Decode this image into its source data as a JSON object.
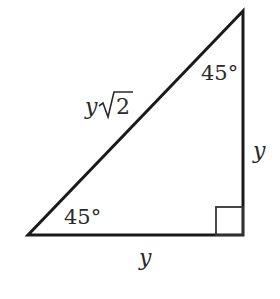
{
  "diagram": {
    "type": "right-triangle-45-45-90",
    "vertices": {
      "top_right": [
        243,
        11
      ],
      "bottom_left": [
        28,
        235
      ],
      "bottom_right": [
        243,
        235
      ]
    },
    "right_angle_marker": {
      "x": 216,
      "y": 207,
      "size": 27
    },
    "labels": {
      "hypotenuse_var": "y",
      "hypotenuse_radical": "2",
      "vertical_side": "y",
      "bottom_side": "y",
      "top_angle": "45°",
      "bottom_angle": "45°"
    },
    "colors": {
      "stroke": "#1a1a1a",
      "text": "#2a2a2a",
      "background": "#ffffff"
    }
  }
}
